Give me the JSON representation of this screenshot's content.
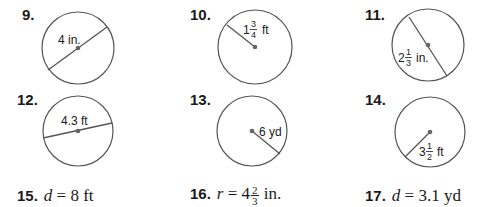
{
  "problems": [
    {
      "number": "9.",
      "label": "4 in.",
      "segment": "diameter"
    },
    {
      "number": "10.",
      "label_whole": "1",
      "label_num": "3",
      "label_den": "4",
      "label_unit": "ft",
      "segment": "radius"
    },
    {
      "number": "11.",
      "label_whole": "2",
      "label_num": "1",
      "label_den": "3",
      "label_unit": "in.",
      "segment": "diameter"
    },
    {
      "number": "12.",
      "label": "4.3 ft",
      "segment": "diameter"
    },
    {
      "number": "13.",
      "label": "6 yd",
      "segment": "radius"
    },
    {
      "number": "14.",
      "label_whole": "3",
      "label_num": "1",
      "label_den": "2",
      "label_unit": "ft",
      "segment": "radius"
    }
  ],
  "text_problems": [
    {
      "number": "15.",
      "var": "d",
      "eq": "=",
      "value": "8 ft"
    },
    {
      "number": "16.",
      "var": "r",
      "eq": "=",
      "whole": "4",
      "num": "2",
      "den": "3",
      "unit": "in."
    },
    {
      "number": "17.",
      "var": "d",
      "eq": "=",
      "value": "3.1 yd"
    }
  ],
  "colors": {
    "stroke": "#555555",
    "text": "#1a1a1a",
    "center_dot": "#666666"
  }
}
